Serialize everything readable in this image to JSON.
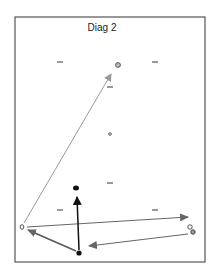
{
  "title": "Diag 2",
  "colors": {
    "frame": "#555555",
    "light_arrow": "#9a9a9a",
    "mid_arrow": "#666666",
    "dark_arrow": "#111111",
    "node_gray": "#777777",
    "node_black": "#111111"
  },
  "nodes": [
    {
      "id": "top",
      "x": 118,
      "y": 65,
      "style": "ring-gray"
    },
    {
      "id": "center-small",
      "x": 110,
      "y": 134,
      "style": "ring-small"
    },
    {
      "id": "middle-bold",
      "x": 76,
      "y": 188,
      "style": "filled-black"
    },
    {
      "id": "left",
      "x": 22,
      "y": 227,
      "style": "ring-gray"
    },
    {
      "id": "bottom",
      "x": 79,
      "y": 253,
      "style": "filled-black"
    },
    {
      "id": "right-a",
      "x": 190,
      "y": 227,
      "style": "ring-gray"
    },
    {
      "id": "right-b",
      "x": 193,
      "y": 232,
      "style": "ring-gray"
    }
  ],
  "dashes": [
    {
      "x": 60,
      "y": 62
    },
    {
      "x": 155,
      "y": 62
    },
    {
      "x": 110,
      "y": 87
    },
    {
      "x": 110,
      "y": 183
    },
    {
      "x": 60,
      "y": 210
    },
    {
      "x": 155,
      "y": 210
    }
  ],
  "edges": [
    {
      "from": "left",
      "to": "top",
      "style": "light"
    },
    {
      "from": "left",
      "to": "right-a",
      "style": "mid"
    },
    {
      "from": "bottom",
      "to": "left",
      "style": "mid"
    },
    {
      "from": "bottom",
      "to": "middle-bold",
      "style": "dark"
    },
    {
      "from": "right-b",
      "to": "bottom",
      "style": "mid"
    }
  ]
}
